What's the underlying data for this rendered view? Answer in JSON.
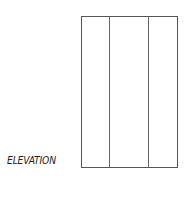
{
  "diagram": {
    "label": "ELEVATION",
    "panel": {
      "columns": 3,
      "divider_offsets_px": [
        28,
        67
      ]
    },
    "colors": {
      "line": "#555555",
      "text": "#222222",
      "background": "#ffffff"
    }
  }
}
